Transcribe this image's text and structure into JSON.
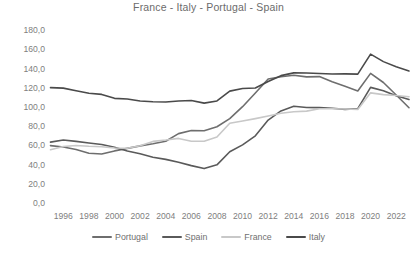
{
  "chart_data": {
    "type": "line",
    "title": "France - Italy - Portugal - Spain",
    "xlabel": "",
    "ylabel": "",
    "grid": false,
    "legend_position": "bottom",
    "ylim": [
      0,
      180
    ],
    "yticks": [
      "0,0",
      "20,0",
      "40,0",
      "60,0",
      "80,0",
      "100,0",
      "120,0",
      "140,0",
      "160,0",
      "180,0"
    ],
    "ytick_values": [
      0,
      20,
      40,
      60,
      80,
      100,
      120,
      140,
      160,
      180
    ],
    "x": [
      1995,
      1996,
      1997,
      1998,
      1999,
      2000,
      2001,
      2002,
      2003,
      2004,
      2005,
      2006,
      2007,
      2008,
      2009,
      2010,
      2011,
      2012,
      2013,
      2014,
      2015,
      2016,
      2017,
      2018,
      2019,
      2020,
      2021,
      2022,
      2023
    ],
    "xticks": [
      "1996",
      "1998",
      "2000",
      "2002",
      "2004",
      "2006",
      "2008",
      "2010",
      "2012",
      "2014",
      "2016",
      "2018",
      "2020",
      "2022"
    ],
    "xtick_values": [
      1996,
      1998,
      2000,
      2002,
      2004,
      2006,
      2008,
      2010,
      2012,
      2014,
      2016,
      2018,
      2020,
      2022
    ],
    "series": [
      {
        "name": "Portugal",
        "color": "#6e6e6e",
        "values": [
          59.7,
          58.2,
          55.6,
          51.8,
          51.0,
          54.2,
          56.8,
          59.4,
          61.6,
          64.2,
          72.2,
          75.4,
          75.1,
          79.3,
          87.8,
          100.2,
          114.4,
          129.0,
          131.4,
          132.9,
          131.2,
          131.5,
          126.1,
          121.5,
          116.6,
          134.9,
          125.4,
          112.4,
          99.1
        ]
      },
      {
        "name": "Spain",
        "color": "#5a5a5a",
        "values": [
          63.3,
          65.6,
          64.1,
          62.4,
          60.9,
          58.0,
          54.2,
          51.3,
          47.6,
          45.4,
          42.4,
          38.9,
          35.8,
          39.7,
          53.3,
          60.5,
          69.9,
          86.3,
          95.8,
          100.7,
          99.3,
          99.2,
          98.6,
          97.4,
          98.2,
          120.3,
          116.8,
          111.6,
          107.7
        ]
      },
      {
        "name": "France",
        "color": "#c8c8c8",
        "values": [
          55.4,
          58.8,
          59.9,
          59.1,
          58.6,
          57.2,
          57.0,
          59.6,
          64.1,
          65.5,
          67.2,
          64.2,
          64.2,
          68.7,
          82.9,
          85.3,
          87.8,
          90.6,
          93.4,
          94.9,
          95.6,
          98.0,
          98.1,
          97.8,
          97.4,
          114.6,
          112.8,
          111.8,
          110.6
        ]
      },
      {
        "name": "Italy",
        "color": "#4a4a4a",
        "values": [
          120.0,
          119.5,
          116.8,
          114.2,
          113.0,
          108.9,
          108.2,
          106.1,
          105.4,
          105.1,
          106.2,
          106.6,
          103.9,
          106.2,
          116.4,
          119.2,
          119.7,
          126.5,
          132.5,
          135.4,
          135.3,
          134.8,
          134.2,
          134.4,
          134.1,
          154.9,
          147.1,
          141.7,
          137.3
        ]
      }
    ]
  },
  "legend": {
    "items": [
      {
        "label": "Portugal",
        "color": "#6e6e6e"
      },
      {
        "label": "Spain",
        "color": "#5a5a5a"
      },
      {
        "label": "France",
        "color": "#c8c8c8"
      },
      {
        "label": "Italy",
        "color": "#4a4a4a"
      }
    ]
  },
  "colors": {
    "background": "#ffffff",
    "title_text": "#6b6b6b",
    "tick_text": "#808080"
  }
}
